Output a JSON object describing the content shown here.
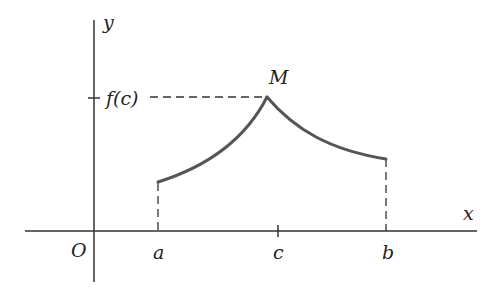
{
  "diagram": {
    "type": "function-graph",
    "axes": {
      "x_label": "x",
      "y_label": "y",
      "origin_label": "O"
    },
    "x_ticks": [
      {
        "label": "a"
      },
      {
        "label": "c"
      },
      {
        "label": "b"
      }
    ],
    "y_ticks": [
      {
        "label": "f(c)"
      }
    ],
    "points": [
      {
        "label": "M",
        "description": "maximum point at (c, f(c))"
      }
    ],
    "curve": {
      "description": "Piecewise curve from x=a to x=b, increasing concave-up to a cusp maximum M at x=c, then decreasing concave-up to x=b",
      "start": "a",
      "peak": "c",
      "end": "b"
    },
    "guides": [
      {
        "description": "dashed horizontal line from f(c) on y-axis to M"
      },
      {
        "description": "dashed vertical line from curve at a down to x-axis"
      },
      {
        "description": "dashed vertical line from curve at b down to x-axis"
      }
    ],
    "colors": {
      "axes": "#333333",
      "curve": "#555555",
      "text": "#222222",
      "background": "#ffffff"
    }
  }
}
